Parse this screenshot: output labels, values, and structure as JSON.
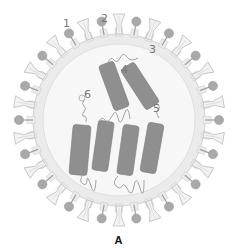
{
  "figure": {
    "caption": "A",
    "labels": [
      {
        "id": "1",
        "text": "1",
        "x": 63,
        "y": 17
      },
      {
        "id": "2",
        "text": "2",
        "x": 101,
        "y": 12
      },
      {
        "id": "3",
        "text": "3",
        "x": 149,
        "y": 43
      },
      {
        "id": "4",
        "text": "4",
        "x": 121,
        "y": 63
      },
      {
        "id": "5",
        "text": "5",
        "x": 153,
        "y": 102
      },
      {
        "id": "6",
        "text": "6",
        "x": 84,
        "y": 88
      }
    ],
    "colors": {
      "background": "#ffffff",
      "spike_outline": "#b8b8b8",
      "spike_fill": "#f2f2f2",
      "ball_head": "#a9a9a9",
      "membrane": "#e6e6e6",
      "interior": "#f7f7f7",
      "segment": "#8f8f8f",
      "strand": "#9a9a9a",
      "label": "#777777",
      "caption": "#111111"
    }
  }
}
